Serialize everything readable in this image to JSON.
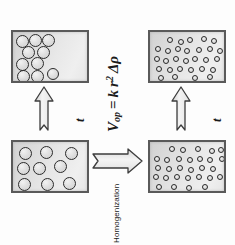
{
  "figure": {
    "background_color": "#fdfdfd",
    "box_border_color": "#5a5a5a",
    "droplet_outline_color": "#2b2b2b"
  },
  "formula": {
    "variable": "V",
    "subscript": "op",
    "equals": "=",
    "constant": "k",
    "radius": "r",
    "exponent": "2",
    "delta_rho": "Δρ",
    "full_text": "V_op = k r² Δρ"
  },
  "labels": {
    "time_left": "t",
    "time_right": "t",
    "homogenization": "Homogenization"
  },
  "panels": [
    {
      "id": "box-tl",
      "name": "coarse-emulsion-creamed",
      "droplet_size": "large",
      "droplet_count": 10,
      "distribution": "clustered-left",
      "droplets": [
        {
          "cx": 9,
          "cy": 9,
          "r": 6.5
        },
        {
          "cx": 22,
          "cy": 8,
          "r": 6.5
        },
        {
          "cx": 35,
          "cy": 8,
          "r": 6.5
        },
        {
          "cx": 15,
          "cy": 20,
          "r": 6.5
        },
        {
          "cx": 30,
          "cy": 20,
          "r": 6.5
        },
        {
          "cx": 9,
          "cy": 32,
          "r": 6.5
        },
        {
          "cx": 24,
          "cy": 31,
          "r": 6.5
        },
        {
          "cx": 10,
          "cy": 44,
          "r": 6.5
        },
        {
          "cx": 24,
          "cy": 44,
          "r": 6.5
        },
        {
          "cx": 40,
          "cy": 42,
          "r": 6.0
        }
      ]
    },
    {
      "id": "box-bl",
      "name": "coarse-emulsion-dispersed",
      "droplet_size": "large",
      "droplet_count": 9,
      "distribution": "uniform",
      "droplets": [
        {
          "cx": 12,
          "cy": 11,
          "r": 6.5
        },
        {
          "cx": 33,
          "cy": 10,
          "r": 6.5
        },
        {
          "cx": 58,
          "cy": 11,
          "r": 6.5
        },
        {
          "cx": 10,
          "cy": 26,
          "r": 6.5
        },
        {
          "cx": 26,
          "cy": 26,
          "r": 6.5
        },
        {
          "cx": 47,
          "cy": 24,
          "r": 6.5
        },
        {
          "cx": 11,
          "cy": 42,
          "r": 6.5
        },
        {
          "cx": 34,
          "cy": 42,
          "r": 6.5
        },
        {
          "cx": 56,
          "cy": 41,
          "r": 6.5
        }
      ]
    },
    {
      "id": "box-tr",
      "name": "fine-emulsion-stable",
      "droplet_size": "small",
      "droplet_count": 29,
      "distribution": "uniform",
      "droplets": [
        {
          "cx": 20,
          "cy": 8,
          "r": 3.3
        },
        {
          "cx": 31,
          "cy": 10,
          "r": 3.3
        },
        {
          "cx": 40,
          "cy": 8,
          "r": 3.3
        },
        {
          "cx": 54,
          "cy": 7,
          "r": 3.3
        },
        {
          "cx": 64,
          "cy": 9,
          "r": 3.3
        },
        {
          "cx": 8,
          "cy": 17,
          "r": 3.3
        },
        {
          "cx": 18,
          "cy": 19,
          "r": 3.3
        },
        {
          "cx": 28,
          "cy": 17,
          "r": 3.3
        },
        {
          "cx": 37,
          "cy": 19,
          "r": 3.3
        },
        {
          "cx": 49,
          "cy": 18,
          "r": 3.3
        },
        {
          "cx": 60,
          "cy": 17,
          "r": 3.3
        },
        {
          "cx": 70,
          "cy": 19,
          "r": 3.3
        },
        {
          "cx": 7,
          "cy": 27,
          "r": 3.3
        },
        {
          "cx": 16,
          "cy": 29,
          "r": 3.3
        },
        {
          "cx": 26,
          "cy": 27,
          "r": 3.3
        },
        {
          "cx": 36,
          "cy": 29,
          "r": 3.3
        },
        {
          "cx": 45,
          "cy": 27,
          "r": 3.3
        },
        {
          "cx": 56,
          "cy": 28,
          "r": 3.3
        },
        {
          "cx": 67,
          "cy": 27,
          "r": 3.3
        },
        {
          "cx": 9,
          "cy": 37,
          "r": 3.3
        },
        {
          "cx": 20,
          "cy": 38,
          "r": 3.3
        },
        {
          "cx": 30,
          "cy": 37,
          "r": 3.3
        },
        {
          "cx": 41,
          "cy": 38,
          "r": 3.3
        },
        {
          "cx": 52,
          "cy": 37,
          "r": 3.3
        },
        {
          "cx": 63,
          "cy": 38,
          "r": 3.3
        },
        {
          "cx": 11,
          "cy": 46,
          "r": 3.3
        },
        {
          "cx": 25,
          "cy": 45,
          "r": 3.3
        },
        {
          "cx": 45,
          "cy": 46,
          "r": 3.3
        },
        {
          "cx": 60,
          "cy": 45,
          "r": 3.3
        }
      ]
    },
    {
      "id": "box-br",
      "name": "fine-emulsion-homogenized",
      "droplet_size": "small",
      "droplet_count": 29,
      "distribution": "uniform",
      "droplets": [
        {
          "cx": 22,
          "cy": 7,
          "r": 3.3
        },
        {
          "cx": 33,
          "cy": 8,
          "r": 3.3
        },
        {
          "cx": 48,
          "cy": 7,
          "r": 3.3
        },
        {
          "cx": 62,
          "cy": 9,
          "r": 3.3
        },
        {
          "cx": 71,
          "cy": 8,
          "r": 3.2
        },
        {
          "cx": 7,
          "cy": 17,
          "r": 3.3
        },
        {
          "cx": 17,
          "cy": 18,
          "r": 3.3
        },
        {
          "cx": 29,
          "cy": 17,
          "r": 3.3
        },
        {
          "cx": 40,
          "cy": 18,
          "r": 3.3
        },
        {
          "cx": 50,
          "cy": 17,
          "r": 3.3
        },
        {
          "cx": 60,
          "cy": 18,
          "r": 3.3
        },
        {
          "cx": 72,
          "cy": 17,
          "r": 3.2
        },
        {
          "cx": 8,
          "cy": 26,
          "r": 3.3
        },
        {
          "cx": 19,
          "cy": 27,
          "r": 3.3
        },
        {
          "cx": 30,
          "cy": 26,
          "r": 3.3
        },
        {
          "cx": 41,
          "cy": 28,
          "r": 3.3
        },
        {
          "cx": 52,
          "cy": 26,
          "r": 3.3
        },
        {
          "cx": 63,
          "cy": 27,
          "r": 3.3
        },
        {
          "cx": 6,
          "cy": 35,
          "r": 3.3
        },
        {
          "cx": 16,
          "cy": 36,
          "r": 3.3
        },
        {
          "cx": 27,
          "cy": 35,
          "r": 3.3
        },
        {
          "cx": 38,
          "cy": 36,
          "r": 3.3
        },
        {
          "cx": 49,
          "cy": 35,
          "r": 3.3
        },
        {
          "cx": 60,
          "cy": 36,
          "r": 3.3
        },
        {
          "cx": 70,
          "cy": 35,
          "r": 3.2
        },
        {
          "cx": 9,
          "cy": 45,
          "r": 3.3
        },
        {
          "cx": 24,
          "cy": 45,
          "r": 3.3
        },
        {
          "cx": 39,
          "cy": 46,
          "r": 3.3
        },
        {
          "cx": 55,
          "cy": 45,
          "r": 3.3
        }
      ]
    }
  ],
  "arrows": [
    {
      "id": "arrow-left",
      "name": "time-arrow-left",
      "direction": "up",
      "style": "outline-fletched"
    },
    {
      "id": "arrow-right",
      "name": "time-arrow-right",
      "direction": "up",
      "style": "outline-fletched"
    },
    {
      "id": "arrow-mid",
      "name": "homogenization-arrow",
      "direction": "right",
      "style": "outline-fletched"
    }
  ]
}
